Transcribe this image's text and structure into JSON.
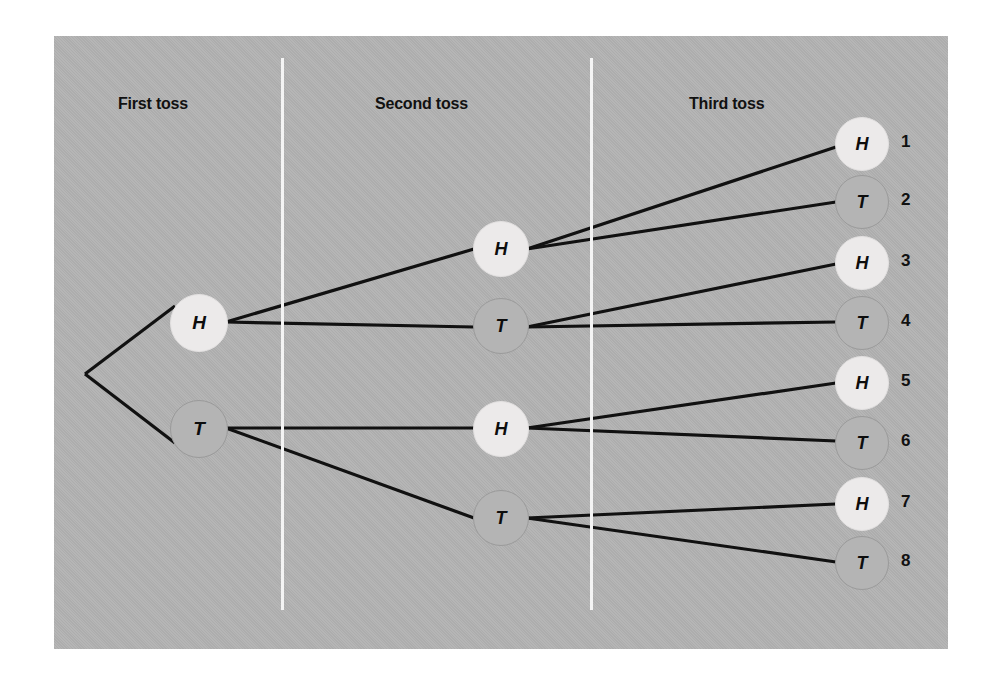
{
  "figure": {
    "type": "probability-tree-diagram",
    "background_color": "#b2b2b2",
    "page_color": "#ffffff",
    "line_color": "#111111",
    "head_node_color": "#eceaea",
    "tail_node_color": "#b4b4b4",
    "head_label": "H",
    "tail_label": "T"
  },
  "stage_labels": [
    {
      "id": "first",
      "text": "First toss",
      "x": 118,
      "y": 95
    },
    {
      "id": "second",
      "text": "Second toss",
      "x": 375,
      "y": 95
    },
    {
      "id": "third",
      "text": "Third toss",
      "x": 689,
      "y": 95
    }
  ],
  "dividers": [
    {
      "id": "divider-1",
      "x": 281,
      "y": 58,
      "height": 552
    },
    {
      "id": "divider-2",
      "x": 590,
      "y": 58,
      "height": 552
    }
  ],
  "root": {
    "id": "root",
    "x": 85,
    "y": 374
  },
  "nodes": [
    {
      "id": "n1-h",
      "label": "H",
      "kind": "head",
      "level": 1,
      "cx": 198,
      "cy": 322,
      "r": 28,
      "font": 19
    },
    {
      "id": "n1-t",
      "label": "T",
      "kind": "tail",
      "level": 1,
      "cx": 198,
      "cy": 428,
      "r": 28,
      "font": 19
    },
    {
      "id": "n2-hh",
      "label": "H",
      "kind": "head",
      "level": 2,
      "cx": 500,
      "cy": 248,
      "r": 27,
      "font": 18
    },
    {
      "id": "n2-ht",
      "label": "T",
      "kind": "tail",
      "level": 2,
      "cx": 500,
      "cy": 325,
      "r": 27,
      "font": 18
    },
    {
      "id": "n2-th",
      "label": "H",
      "kind": "head",
      "level": 2,
      "cx": 500,
      "cy": 428,
      "r": 27,
      "font": 18
    },
    {
      "id": "n2-tt",
      "label": "T",
      "kind": "tail",
      "level": 2,
      "cx": 500,
      "cy": 517,
      "r": 27,
      "font": 18
    },
    {
      "id": "n3-hhh",
      "label": "H",
      "kind": "head",
      "level": 3,
      "cx": 861,
      "cy": 143,
      "r": 26,
      "font": 18
    },
    {
      "id": "n3-hht",
      "label": "T",
      "kind": "tail",
      "level": 3,
      "cx": 861,
      "cy": 201,
      "r": 26,
      "font": 18
    },
    {
      "id": "n3-hth",
      "label": "H",
      "kind": "head",
      "level": 3,
      "cx": 861,
      "cy": 262,
      "r": 26,
      "font": 18
    },
    {
      "id": "n3-htt",
      "label": "T",
      "kind": "tail",
      "level": 3,
      "cx": 861,
      "cy": 322,
      "r": 26,
      "font": 18
    },
    {
      "id": "n3-thh",
      "label": "H",
      "kind": "head",
      "level": 3,
      "cx": 861,
      "cy": 382,
      "r": 26,
      "font": 18
    },
    {
      "id": "n3-tht",
      "label": "T",
      "kind": "tail",
      "level": 3,
      "cx": 861,
      "cy": 442,
      "r": 26,
      "font": 18
    },
    {
      "id": "n3-tth",
      "label": "H",
      "kind": "head",
      "level": 3,
      "cx": 861,
      "cy": 503,
      "r": 26,
      "font": 18
    },
    {
      "id": "n3-ttt",
      "label": "T",
      "kind": "tail",
      "level": 3,
      "cx": 861,
      "cy": 562,
      "r": 26,
      "font": 18
    }
  ],
  "edges": [
    {
      "id": "e-root-h",
      "from": "root",
      "to": "n1-h",
      "x1": 85,
      "y1": 374,
      "x2": 175,
      "y2": 306
    },
    {
      "id": "e-root-t",
      "from": "root",
      "to": "n1-t",
      "x1": 85,
      "y1": 374,
      "x2": 175,
      "y2": 443
    },
    {
      "id": "e-h-hh",
      "from": "n1-h",
      "to": "n2-hh",
      "x1": 226,
      "y1": 322,
      "x2": 474,
      "y2": 249
    },
    {
      "id": "e-h-ht",
      "from": "n1-h",
      "to": "n2-ht",
      "x1": 226,
      "y1": 322,
      "x2": 474,
      "y2": 327
    },
    {
      "id": "e-t-th",
      "from": "n1-t",
      "to": "n2-th",
      "x1": 226,
      "y1": 428,
      "x2": 474,
      "y2": 428
    },
    {
      "id": "e-t-tt",
      "from": "n1-t",
      "to": "n2-tt",
      "x1": 226,
      "y1": 428,
      "x2": 474,
      "y2": 518
    },
    {
      "id": "e-hh-1",
      "from": "n2-hh",
      "to": "n3-hhh",
      "x1": 527,
      "y1": 249,
      "x2": 836,
      "y2": 147
    },
    {
      "id": "e-hh-2",
      "from": "n2-hh",
      "to": "n3-hht",
      "x1": 527,
      "y1": 249,
      "x2": 836,
      "y2": 202
    },
    {
      "id": "e-ht-3",
      "from": "n2-ht",
      "to": "n3-hth",
      "x1": 527,
      "y1": 327,
      "x2": 836,
      "y2": 264
    },
    {
      "id": "e-ht-4",
      "from": "n2-ht",
      "to": "n3-htt",
      "x1": 527,
      "y1": 327,
      "x2": 836,
      "y2": 322
    },
    {
      "id": "e-th-5",
      "from": "n2-th",
      "to": "n3-thh",
      "x1": 527,
      "y1": 428,
      "x2": 836,
      "y2": 383
    },
    {
      "id": "e-th-6",
      "from": "n2-th",
      "to": "n3-tht",
      "x1": 527,
      "y1": 428,
      "x2": 836,
      "y2": 441
    },
    {
      "id": "e-tt-7",
      "from": "n2-tt",
      "to": "n3-tth",
      "x1": 527,
      "y1": 518,
      "x2": 836,
      "y2": 504
    },
    {
      "id": "e-tt-8",
      "from": "n2-tt",
      "to": "n3-ttt",
      "x1": 527,
      "y1": 518,
      "x2": 836,
      "y2": 562
    }
  ],
  "outcome_numbers": [
    {
      "id": "outcome-1",
      "text": "1",
      "x": 901,
      "y": 143,
      "sequence": "HHH"
    },
    {
      "id": "outcome-2",
      "text": "2",
      "x": 901,
      "y": 201,
      "sequence": "HHT"
    },
    {
      "id": "outcome-3",
      "text": "3",
      "x": 901,
      "y": 262,
      "sequence": "HTH"
    },
    {
      "id": "outcome-4",
      "text": "4",
      "x": 901,
      "y": 322,
      "sequence": "HTT"
    },
    {
      "id": "outcome-5",
      "text": "5",
      "x": 901,
      "y": 382,
      "sequence": "THH"
    },
    {
      "id": "outcome-6",
      "text": "6",
      "x": 901,
      "y": 442,
      "sequence": "THT"
    },
    {
      "id": "outcome-7",
      "text": "7",
      "x": 901,
      "y": 503,
      "sequence": "TTH"
    },
    {
      "id": "outcome-8",
      "text": "8",
      "x": 901,
      "y": 562,
      "sequence": "TTT"
    }
  ]
}
